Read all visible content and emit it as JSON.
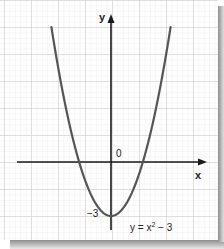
{
  "chart_data": {
    "type": "line",
    "title": "",
    "equation": "y = x² - 3",
    "xlabel": "x",
    "ylabel": "y",
    "origin_label": "0",
    "annotations": [
      {
        "text": "-3",
        "at": [
          0,
          -3
        ],
        "meaning": "y-intercept / vertex"
      },
      {
        "text": "y = x² - 3",
        "position": "below-right of vertex"
      }
    ],
    "series": [
      {
        "name": "y = x^2 - 3",
        "x": [
          -3,
          -2.5,
          -2,
          -1.732,
          -1.5,
          -1,
          -0.5,
          0,
          0.5,
          1,
          1.5,
          1.732,
          2,
          2.5,
          3
        ],
        "y": [
          6,
          3.25,
          1,
          0,
          -0.75,
          -2,
          -2.75,
          -3,
          -2.75,
          -2,
          -0.75,
          0,
          1,
          3.25,
          6
        ],
        "color": "#555555"
      }
    ],
    "vertex": [
      0,
      -3
    ],
    "roots": [
      -1.732,
      1.732
    ],
    "xlim": [
      -5,
      5
    ],
    "ylim": [
      -4,
      8
    ],
    "grid": true,
    "legend": "none"
  },
  "labels": {
    "y_axis": "y",
    "x_axis": "x",
    "origin": "0",
    "vertex_value": "−3",
    "equation_base": "y = x",
    "equation_exp": "2",
    "equation_tail": " − 3"
  },
  "colors": {
    "paper": "#ffffff",
    "minor_grid": "#e4e4e4",
    "major_grid": "#c8c8c8",
    "axis": "#1a1a1a",
    "curve": "#555555",
    "shadow": "#9a9a9a"
  }
}
